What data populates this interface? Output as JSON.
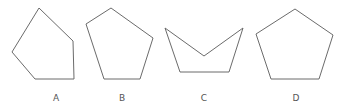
{
  "figure": {
    "shapes": [
      {
        "id": "A",
        "label": "A",
        "type": "pentagon-irregular",
        "points": "39,8 73,41 74,79 35,79 12,52",
        "label_x": 56
      },
      {
        "id": "B",
        "label": "B",
        "type": "pentagon-irregular",
        "points": "111,8 153,38 140,79 104,79 86,24",
        "label_x": 122
      },
      {
        "id": "C",
        "label": "C",
        "type": "concave-pentagon",
        "points": "165,28 204,56 243,28 229,72 180,72",
        "label_x": 204
      },
      {
        "id": "D",
        "label": "D",
        "type": "pentagon-regular",
        "points": "295,9 333,35 319,79 271,79 256,34",
        "label_x": 296
      }
    ],
    "stroke_color": "#6b6b6b",
    "label_color": "#555555"
  }
}
